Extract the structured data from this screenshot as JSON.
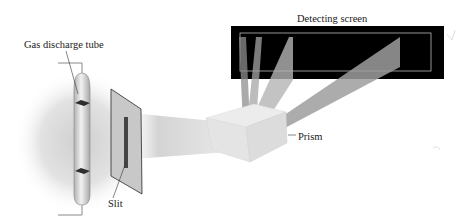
{
  "labels": {
    "gas_discharge_tube": "Gas discharge tube",
    "slit": "Slit",
    "prism": "Prism",
    "detecting_screen": "Detecting screen"
  },
  "components": [
    {
      "id": "gas-discharge-tube",
      "label": "Gas discharge tube"
    },
    {
      "id": "slit-plate",
      "label": "Slit"
    },
    {
      "id": "prism",
      "label": "Prism"
    },
    {
      "id": "detecting-screen",
      "label": "Detecting screen"
    }
  ],
  "spectral_lines_count": 4,
  "colors": {
    "screen_fill": "#000000",
    "screen_frame": "#b8b8b8",
    "glow": "#d8d8d8",
    "beam": "#9a9a9a",
    "text": "#1a1a1a"
  }
}
